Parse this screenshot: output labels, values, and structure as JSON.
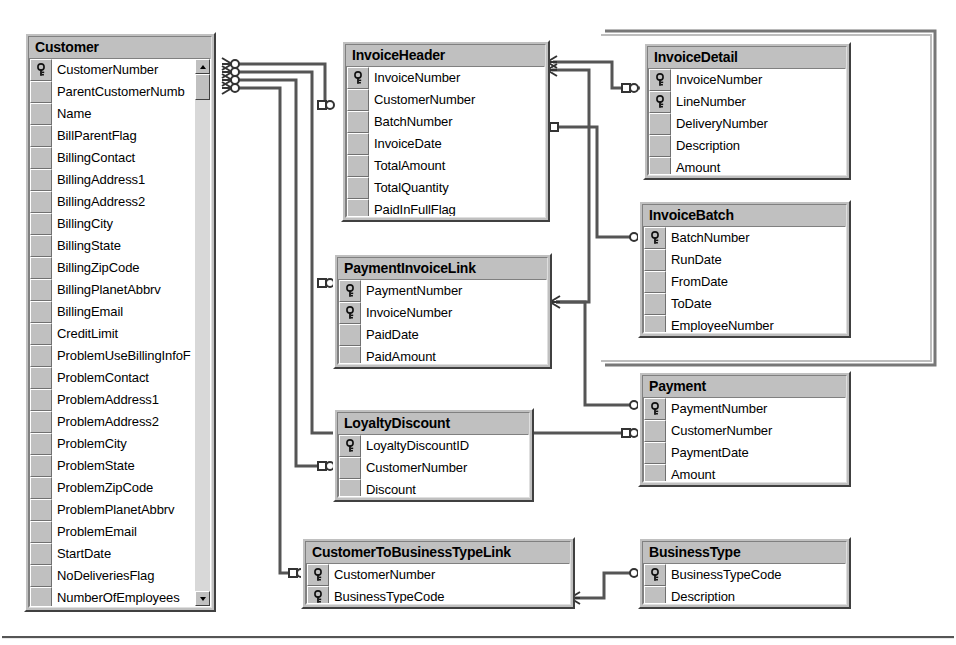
{
  "diagram": {
    "tables": [
      {
        "id": "customer",
        "name": "Customer",
        "has_scrollbar": true,
        "fields": [
          {
            "name": "CustomerNumber",
            "key": true
          },
          {
            "name": "ParentCustomerNumb",
            "key": false
          },
          {
            "name": "Name",
            "key": false
          },
          {
            "name": "BillParentFlag",
            "key": false
          },
          {
            "name": "BillingContact",
            "key": false
          },
          {
            "name": "BillingAddress1",
            "key": false
          },
          {
            "name": "BillingAddress2",
            "key": false
          },
          {
            "name": "BillingCity",
            "key": false
          },
          {
            "name": "BillingState",
            "key": false
          },
          {
            "name": "BillingZipCode",
            "key": false
          },
          {
            "name": "BillingPlanetAbbrv",
            "key": false
          },
          {
            "name": "BillingEmail",
            "key": false
          },
          {
            "name": "CreditLimit",
            "key": false
          },
          {
            "name": "ProblemUseBillingInfoF",
            "key": false
          },
          {
            "name": "ProblemContact",
            "key": false
          },
          {
            "name": "ProblemAddress1",
            "key": false
          },
          {
            "name": "ProblemAddress2",
            "key": false
          },
          {
            "name": "ProblemCity",
            "key": false
          },
          {
            "name": "ProblemState",
            "key": false
          },
          {
            "name": "ProblemZipCode",
            "key": false
          },
          {
            "name": "ProblemPlanetAbbrv",
            "key": false
          },
          {
            "name": "ProblemEmail",
            "key": false
          },
          {
            "name": "StartDate",
            "key": false
          },
          {
            "name": "NoDeliveriesFlag",
            "key": false
          },
          {
            "name": "NumberOfEmployees",
            "key": false
          }
        ]
      },
      {
        "id": "invoiceheader",
        "name": "InvoiceHeader",
        "has_scrollbar": false,
        "fields": [
          {
            "name": "InvoiceNumber",
            "key": true
          },
          {
            "name": "CustomerNumber",
            "key": false
          },
          {
            "name": "BatchNumber",
            "key": false
          },
          {
            "name": "InvoiceDate",
            "key": false
          },
          {
            "name": "TotalAmount",
            "key": false
          },
          {
            "name": "TotalQuantity",
            "key": false
          },
          {
            "name": "PaidInFullFlag",
            "key": false
          }
        ]
      },
      {
        "id": "invoicedetail",
        "name": "InvoiceDetail",
        "has_scrollbar": false,
        "fields": [
          {
            "name": "InvoiceNumber",
            "key": true
          },
          {
            "name": "LineNumber",
            "key": true
          },
          {
            "name": "DeliveryNumber",
            "key": false
          },
          {
            "name": "Description",
            "key": false
          },
          {
            "name": "Amount",
            "key": false
          }
        ]
      },
      {
        "id": "invoicebatch",
        "name": "InvoiceBatch",
        "has_scrollbar": false,
        "fields": [
          {
            "name": "BatchNumber",
            "key": true
          },
          {
            "name": "RunDate",
            "key": false
          },
          {
            "name": "FromDate",
            "key": false
          },
          {
            "name": "ToDate",
            "key": false
          },
          {
            "name": "EmployeeNumber",
            "key": false
          }
        ]
      },
      {
        "id": "paymentinvoicelink",
        "name": "PaymentInvoiceLink",
        "has_scrollbar": false,
        "fields": [
          {
            "name": "PaymentNumber",
            "key": true
          },
          {
            "name": "InvoiceNumber",
            "key": true
          },
          {
            "name": "PaidDate",
            "key": false
          },
          {
            "name": "PaidAmount",
            "key": false
          }
        ]
      },
      {
        "id": "loyaltydiscount",
        "name": "LoyaltyDiscount",
        "has_scrollbar": false,
        "fields": [
          {
            "name": "LoyaltyDiscountID",
            "key": true
          },
          {
            "name": "CustomerNumber",
            "key": false
          },
          {
            "name": "Discount",
            "key": false
          }
        ]
      },
      {
        "id": "payment",
        "name": "Payment",
        "has_scrollbar": false,
        "fields": [
          {
            "name": "PaymentNumber",
            "key": true
          },
          {
            "name": "CustomerNumber",
            "key": false
          },
          {
            "name": "PaymentDate",
            "key": false
          },
          {
            "name": "Amount",
            "key": false
          }
        ]
      },
      {
        "id": "customertobusinesstypelink",
        "name": "CustomerToBusinessTypeLink",
        "has_scrollbar": false,
        "fields": [
          {
            "name": "CustomerNumber",
            "key": true
          },
          {
            "name": "BusinessTypeCode",
            "key": true
          }
        ]
      },
      {
        "id": "businesstype",
        "name": "BusinessType",
        "has_scrollbar": false,
        "fields": [
          {
            "name": "BusinessTypeCode",
            "key": true
          },
          {
            "name": "Description",
            "key": false
          }
        ]
      }
    ],
    "relationships": [
      {
        "from": "Customer.CustomerNumber",
        "to": "InvoiceHeader.CustomerNumber",
        "from_card": "many",
        "to_card": "one"
      },
      {
        "from": "Customer.CustomerNumber",
        "to": "LoyaltyDiscount.CustomerNumber",
        "from_card": "many",
        "to_card": "one"
      },
      {
        "from": "Customer.CustomerNumber",
        "to": "CustomerToBusinessTypeLink.CustomerNumber",
        "from_card": "many",
        "to_card": "one"
      },
      {
        "from": "Customer.CustomerNumber",
        "to": "Payment.CustomerNumber",
        "from_card": "many",
        "to_card": "one"
      },
      {
        "from": "InvoiceHeader.InvoiceNumber",
        "to": "InvoiceDetail.InvoiceNumber",
        "from_card": "many",
        "to_card": "one"
      },
      {
        "from": "InvoiceHeader.InvoiceNumber",
        "to": "PaymentInvoiceLink.InvoiceNumber",
        "from_card": "many",
        "to_card": "one"
      },
      {
        "from": "InvoiceHeader.BatchNumber",
        "to": "InvoiceBatch.BatchNumber",
        "from_card": "one",
        "to_card": "one"
      },
      {
        "from": "PaymentInvoiceLink.PaymentNumber",
        "to": "Payment.PaymentNumber",
        "from_card": "many",
        "to_card": "one"
      },
      {
        "from": "CustomerToBusinessTypeLink.BusinessTypeCode",
        "to": "BusinessType.BusinessTypeCode",
        "from_card": "many",
        "to_card": "one"
      }
    ],
    "icons": {
      "primary_key": "key-icon",
      "scroll_up": "scroll-up-arrow-icon",
      "scroll_down": "scroll-down-arrow-icon",
      "crows_foot": "crows-foot-many-icon",
      "one_marker": "one-cardinality-icon"
    },
    "colors": {
      "table_face": "#c0c0c0",
      "field_background": "#ffffff",
      "border_dark": "#404040",
      "border_light": "#ffffff",
      "text": "#000000",
      "connector": "#4a4a4a"
    }
  }
}
